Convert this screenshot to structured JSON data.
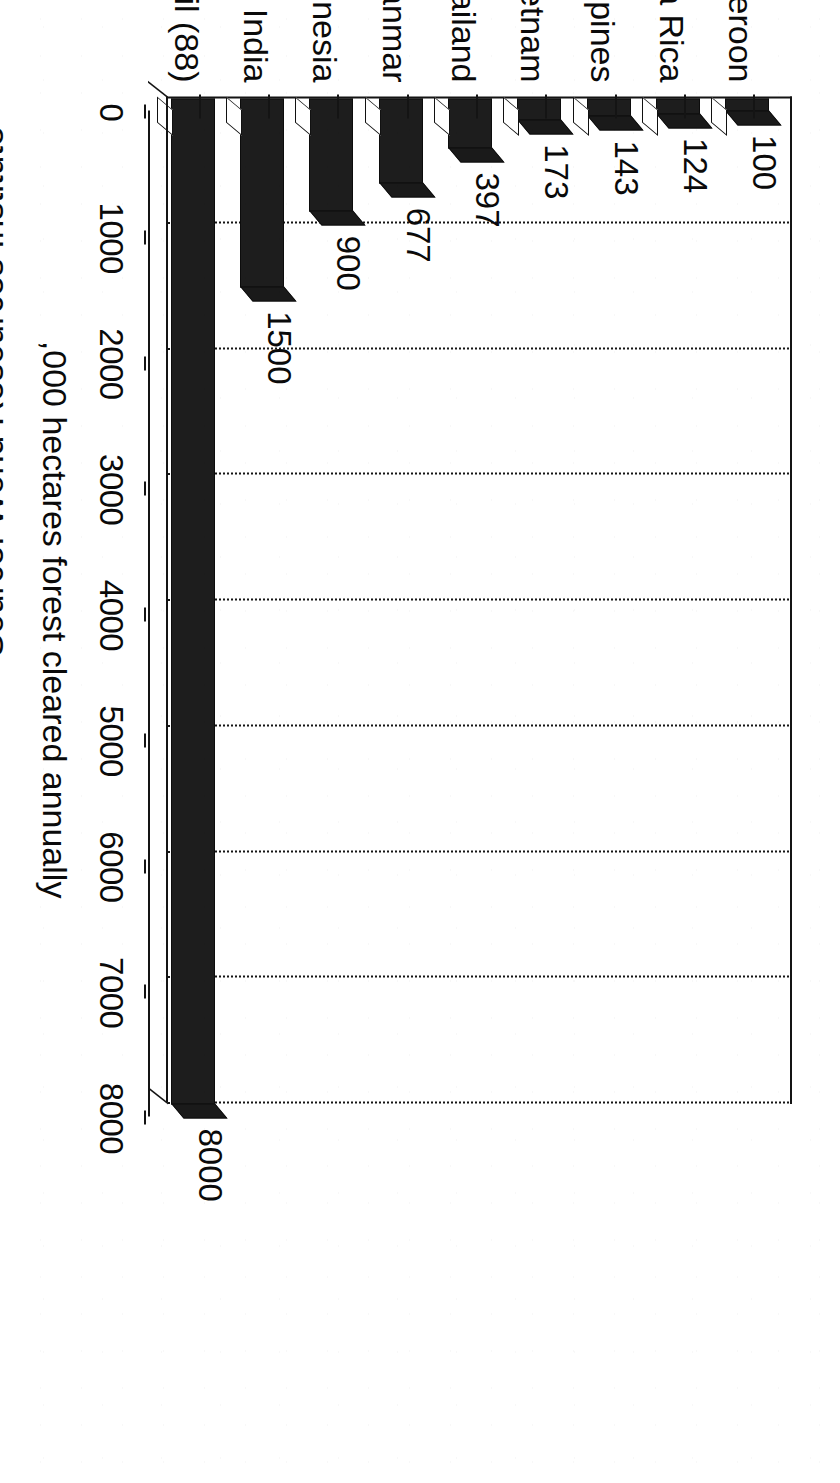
{
  "chart_data": {
    "type": "bar",
    "title": "",
    "subtitle": "",
    "orientation": "vertical",
    "categories": [
      "Cameroon",
      "Costa Rica",
      "Philippines",
      "Vietnam",
      "Thailand",
      "Myanmar",
      "Indonesia",
      "India",
      "Brazil (88)"
    ],
    "values": [
      100,
      124,
      143,
      173,
      397,
      677,
      900,
      1500,
      8000
    ],
    "data_labels": [
      "100",
      "124",
      "143",
      "173",
      "397",
      "677",
      "900",
      "1500",
      "8000"
    ],
    "xlabel": "",
    "ylabel": ",000 hectares forest cleared annually",
    "ylim": [
      0,
      8000
    ],
    "yticks": [
      0,
      1000,
      2000,
      3000,
      4000,
      5000,
      6000,
      7000,
      8000
    ],
    "ytick_labels": [
      "0",
      "1000",
      "2000",
      "3000",
      "4000",
      "5000",
      "6000",
      "7000",
      "8000"
    ],
    "gridlines": "dotted-horizontal",
    "legend": null,
    "legend_position": "none",
    "bar_color": "#1d1d1d",
    "style_3d": true
  },
  "axis": {
    "value_axis_title": ",000 hectares forest cleared annually",
    "tick_labels": [
      "0",
      "1000",
      "2000",
      "3000",
      "4000",
      "5000",
      "6000",
      "7000",
      "8000"
    ]
  },
  "series": {
    "bars": [
      {
        "category": "Cameroon",
        "value": 100,
        "label": "100"
      },
      {
        "category": "Costa Rica",
        "value": 124,
        "label": "124"
      },
      {
        "category": "Philippines",
        "value": 143,
        "label": "143"
      },
      {
        "category": "Vietnam",
        "value": 173,
        "label": "173"
      },
      {
        "category": "Thailand",
        "value": 397,
        "label": "397"
      },
      {
        "category": "Myanmar",
        "value": 677,
        "label": "677"
      },
      {
        "category": "Indonesia",
        "value": 900,
        "label": "900"
      },
      {
        "category": "India",
        "value": 1500,
        "label": "1500"
      },
      {
        "category": "Brazil (88)",
        "value": 8000,
        "label": "8000"
      }
    ]
  },
  "footer": {
    "source_note": "Source: World Resources Institute"
  },
  "colors": {
    "ink": "#0a0a0a",
    "bar_fill": "#1d1d1d",
    "paper": "#ffffff"
  }
}
